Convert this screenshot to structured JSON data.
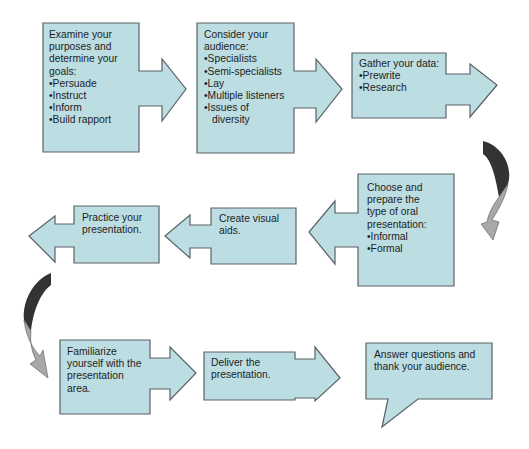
{
  "diagram": {
    "type": "flowchart",
    "colors": {
      "box_fill": "#bcdde2",
      "box_stroke": "#5a6266",
      "curve_dark": "#333333",
      "curve_light": "#a8a8a8",
      "text": "#1e1e1e"
    },
    "steps": [
      {
        "id": "examine",
        "heading": [
          "Examine your",
          "purposes and",
          "determine your",
          "goals:"
        ],
        "bullets": [
          "Persuade",
          "Instruct",
          "Inform",
          "Build rapport"
        ]
      },
      {
        "id": "consider",
        "heading": [
          "Consider your",
          "audience:"
        ],
        "bullets": [
          "Specialists",
          "Semi-specialists",
          "Lay",
          "Multiple listeners",
          "Issues of"
        ],
        "continuation": "diversity"
      },
      {
        "id": "gather",
        "heading": [
          "Gather your data:"
        ],
        "bullets": [
          "Prewrite",
          "Research"
        ]
      },
      {
        "id": "choose",
        "heading": [
          "Choose and",
          "prepare the",
          "type of oral",
          "presentation:"
        ],
        "bullets": [
          "Informal",
          "Formal"
        ]
      },
      {
        "id": "create",
        "heading": [
          "Create visual",
          "aids."
        ]
      },
      {
        "id": "practice",
        "heading": [
          "Practice your",
          "presentation."
        ]
      },
      {
        "id": "familiarize",
        "heading": [
          "Familiarize",
          "yourself with the",
          "presentation",
          "area."
        ]
      },
      {
        "id": "deliver",
        "heading": [
          "Deliver the",
          "presentation."
        ]
      },
      {
        "id": "answer",
        "heading": [
          "Answer questions and",
          "thank your audience."
        ]
      }
    ]
  }
}
